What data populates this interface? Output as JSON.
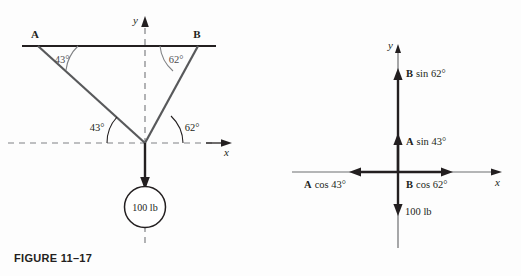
{
  "figure_left": {
    "caption": "FIGURE 11–17",
    "rope_label_a": "A",
    "rope_label_b": "B",
    "angle_a_top": "43°",
    "angle_b_top": "62°",
    "angle_a_bottom": "43°",
    "angle_b_bottom": "62°",
    "axis_x": "x",
    "axis_y": "y",
    "weight_label": "100 lb",
    "colors": {
      "rope": "#58595b",
      "ceiling": "#231f20",
      "axis_dashed": "#808285",
      "arc": "#808285",
      "weight_arrow": "#231f20"
    }
  },
  "figure_right": {
    "caption": "FIGURE 11–18",
    "axis_x": "x",
    "axis_y": "y",
    "vectors": [
      {
        "name": "b-sin-62",
        "bold": "B",
        "rest": " sin 62°"
      },
      {
        "name": "a-sin-43",
        "bold": "A",
        "rest": " sin 43°"
      },
      {
        "name": "a-cos-43",
        "bold": "A",
        "rest": " cos 43°"
      },
      {
        "name": "b-cos-62",
        "bold": "B",
        "rest": " cos 62°"
      },
      {
        "name": "weight",
        "bold": "",
        "rest": "100 lb"
      }
    ],
    "label_b_sin_bold": "B",
    "label_b_sin_rest": "sin 62°",
    "label_a_sin_bold": "A",
    "label_a_sin_rest": "sin 43°",
    "label_a_cos_bold": "A",
    "label_a_cos_rest": "cos 43°",
    "label_b_cos_bold": "B",
    "label_b_cos_rest": "cos 62°",
    "label_weight": "100 lb",
    "colors": {
      "axis": "#231f20",
      "vector": "#231f20",
      "label": "#4d4d4f"
    }
  }
}
